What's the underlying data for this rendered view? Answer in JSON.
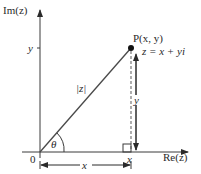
{
  "diagram": {
    "axes": {
      "imaginary_label": "Im(z)",
      "real_label": "Re(z)",
      "origin_label": "0"
    },
    "point": {
      "label": "P(x, y)",
      "equation": "z = x + yi"
    },
    "labels": {
      "modulus": "|z|",
      "angle": "θ",
      "y_tick": "y",
      "x_tick": "x",
      "y_dimension": "y",
      "x_dimension": "x"
    },
    "colors": {
      "line": "#3a3a3a",
      "dashed": "#9a9a9a",
      "text": "#2a2a2a"
    }
  }
}
